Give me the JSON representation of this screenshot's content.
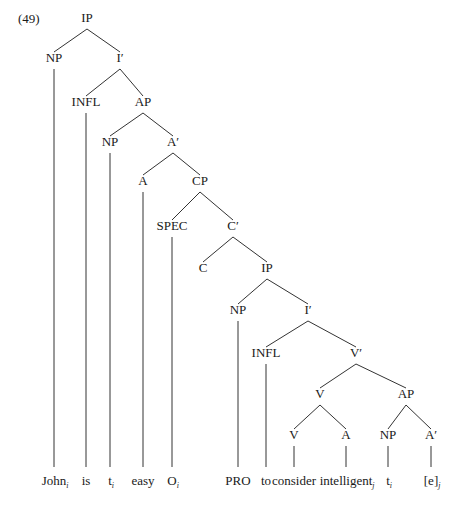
{
  "header_fragment": "Rules of Accommodation Construction Theories",
  "example_number": "(49)",
  "tree": {
    "nodes": [
      {
        "id": "IP1",
        "label": "IP",
        "x": 87,
        "y": 11
      },
      {
        "id": "NP1",
        "label": "NP",
        "x": 54,
        "y": 51
      },
      {
        "id": "Ibar1",
        "label": "I′",
        "x": 120,
        "y": 51
      },
      {
        "id": "INFL1",
        "label": "INFL",
        "x": 86,
        "y": 95
      },
      {
        "id": "AP1",
        "label": "AP",
        "x": 143,
        "y": 95
      },
      {
        "id": "NP2",
        "label": "NP",
        "x": 110,
        "y": 135
      },
      {
        "id": "Abar1",
        "label": "A′",
        "x": 173,
        "y": 135
      },
      {
        "id": "A1",
        "label": "A",
        "x": 143,
        "y": 174
      },
      {
        "id": "CP",
        "label": "CP",
        "x": 200,
        "y": 174
      },
      {
        "id": "SPEC",
        "label": "SPEC",
        "x": 172,
        "y": 219
      },
      {
        "id": "Cbar",
        "label": "C′",
        "x": 233,
        "y": 219
      },
      {
        "id": "C",
        "label": "C",
        "x": 203,
        "y": 261
      },
      {
        "id": "IP2",
        "label": "IP",
        "x": 267,
        "y": 261
      },
      {
        "id": "NP3",
        "label": "NP",
        "x": 238,
        "y": 303
      },
      {
        "id": "Ibar2",
        "label": "I′",
        "x": 308,
        "y": 303
      },
      {
        "id": "INFL2",
        "label": "INFL",
        "x": 266,
        "y": 346
      },
      {
        "id": "Vbar",
        "label": "V′",
        "x": 356,
        "y": 346
      },
      {
        "id": "V1",
        "label": "V",
        "x": 320,
        "y": 387
      },
      {
        "id": "AP2",
        "label": "AP",
        "x": 406,
        "y": 387
      },
      {
        "id": "V2",
        "label": "V",
        "x": 294,
        "y": 428
      },
      {
        "id": "A2",
        "label": "A",
        "x": 346,
        "y": 428
      },
      {
        "id": "NP4",
        "label": "NP",
        "x": 388,
        "y": 428
      },
      {
        "id": "Abar2",
        "label": "A′",
        "x": 431,
        "y": 428
      }
    ],
    "edges": [
      [
        "IP1",
        "NP1"
      ],
      [
        "IP1",
        "Ibar1"
      ],
      [
        "Ibar1",
        "INFL1"
      ],
      [
        "Ibar1",
        "AP1"
      ],
      [
        "AP1",
        "NP2"
      ],
      [
        "AP1",
        "Abar1"
      ],
      [
        "Abar1",
        "A1"
      ],
      [
        "Abar1",
        "CP"
      ],
      [
        "CP",
        "SPEC"
      ],
      [
        "CP",
        "Cbar"
      ],
      [
        "Cbar",
        "C"
      ],
      [
        "Cbar",
        "IP2"
      ],
      [
        "IP2",
        "NP3"
      ],
      [
        "IP2",
        "Ibar2"
      ],
      [
        "Ibar2",
        "INFL2"
      ],
      [
        "Ibar2",
        "Vbar"
      ],
      [
        "Vbar",
        "V1"
      ],
      [
        "Vbar",
        "AP2"
      ],
      [
        "V1",
        "V2"
      ],
      [
        "V1",
        "A2"
      ],
      [
        "AP2",
        "NP4"
      ],
      [
        "AP2",
        "Abar2"
      ]
    ],
    "leaves": [
      {
        "parent": "NP1",
        "x": 54,
        "text": "John",
        "sub": "i"
      },
      {
        "parent": "INFL1",
        "x": 86,
        "text": "is",
        "sub": ""
      },
      {
        "parent": "NP2",
        "x": 110,
        "text": "t",
        "sub": "i"
      },
      {
        "parent": "A1",
        "x": 143,
        "text": "easy",
        "sub": ""
      },
      {
        "parent": "SPEC",
        "x": 172,
        "text": "O",
        "sub": "i"
      },
      {
        "parent": "NP3",
        "x": 238,
        "text": "PRO",
        "sub": ""
      },
      {
        "parent": "INFL2",
        "x": 266,
        "text": "to",
        "sub": ""
      },
      {
        "parent": "V2",
        "x": 294,
        "text": "consider",
        "sub": ""
      },
      {
        "parent": "A2",
        "x": 346,
        "text": "intelligent",
        "sub": "j"
      },
      {
        "parent": "NP4",
        "x": 388,
        "text": "t",
        "sub": "i"
      },
      {
        "parent": "Abar2",
        "x": 431,
        "text": "[e]",
        "sub": "j"
      }
    ]
  }
}
